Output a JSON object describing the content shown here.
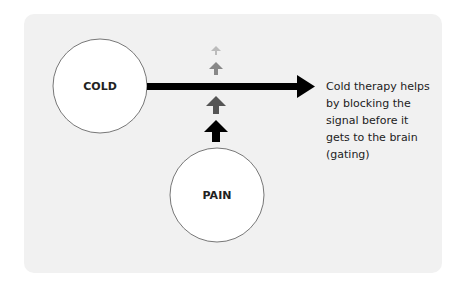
{
  "diagram": {
    "nodes": {
      "cold": {
        "label": "COLD"
      },
      "pain": {
        "label": "PAIN"
      }
    },
    "caption": {
      "lines": [
        "Cold therapy helps",
        "by blocking the",
        "signal before it",
        "gets to the brain",
        "(gating)"
      ]
    },
    "colors": {
      "panel_bg": "#f1f1f1",
      "circle_fill": "#ffffff",
      "circle_stroke": "#777777",
      "main_arrow": "#000000",
      "signal_arrows": [
        "#000000",
        "#555555",
        "#888888",
        "#bbbbbb"
      ]
    }
  }
}
